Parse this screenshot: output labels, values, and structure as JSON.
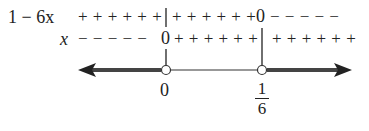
{
  "diagram": {
    "type": "sign_chart",
    "rows": [
      {
        "label": "1 − 6x",
        "left_segment": "+ + + + + +",
        "middle_segment": "+ + + + + +",
        "middle_marker": "0",
        "right_segment": "− − − − −"
      },
      {
        "label": "x",
        "left_segment": "− − − − −",
        "left_marker": "0",
        "middle_segment": "+ + + + + +",
        "right_segment": "+ + + + + +"
      }
    ],
    "number_line": {
      "points": [
        {
          "label": "0",
          "x_value": 0,
          "open": true
        },
        {
          "label_num": "1",
          "label_den": "6",
          "x_value": 0.1667,
          "open": true
        }
      ],
      "solution_segments": [
        "(-∞, 0)",
        "(1/6, ∞)"
      ]
    }
  }
}
